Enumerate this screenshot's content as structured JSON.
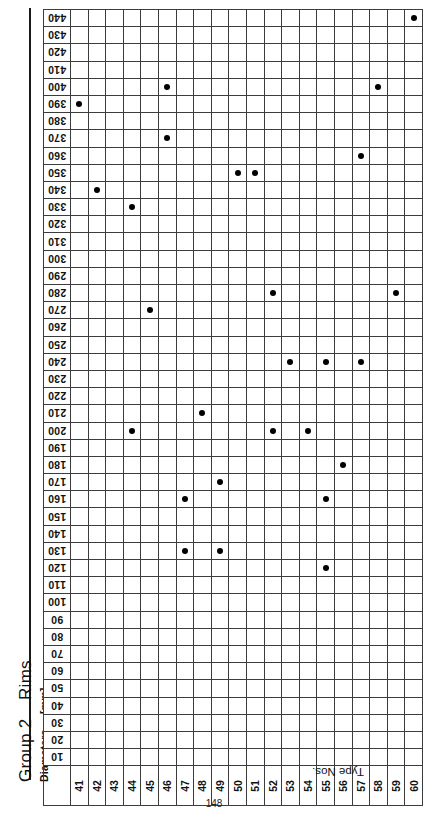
{
  "titles": {
    "group": "Group 2",
    "category": "Rims",
    "axis_name": "Diameters",
    "axis_unit": "[mm]",
    "x_caption": "Type Nos."
  },
  "page_number": "148",
  "chart_data": {
    "type": "scatter",
    "title": "Group 2 Rims",
    "xlabel": "Type Nos.",
    "ylabel": "Diameters [mm]",
    "grid": true,
    "legend_position": "none",
    "x_orientation": "rotated-90",
    "y_orientation": "rotated-180",
    "categories": [
      "41",
      "42",
      "43",
      "44",
      "45",
      "46",
      "47",
      "48",
      "49",
      "50",
      "51",
      "52",
      "53",
      "54",
      "55",
      "56",
      "57",
      "58",
      "59",
      "60"
    ],
    "y_ticks": [
      "440",
      "430",
      "420",
      "410",
      "400",
      "390",
      "380",
      "370",
      "360",
      "350",
      "340",
      "330",
      "320",
      "310",
      "300",
      "290",
      "280",
      "270",
      "260",
      "250",
      "240",
      "230",
      "220",
      "210",
      "200",
      "190",
      "180",
      "170",
      "160",
      "150",
      "140",
      "130",
      "120",
      "110",
      "100",
      "90",
      "80",
      "70",
      "60",
      "50",
      "40",
      "30",
      "20",
      "10"
    ],
    "ylim": [
      10,
      440
    ],
    "y_step": 10,
    "points": [
      {
        "type": "60",
        "diameter": "440"
      },
      {
        "type": "46",
        "diameter": "400"
      },
      {
        "type": "58",
        "diameter": "400"
      },
      {
        "type": "41",
        "diameter": "390"
      },
      {
        "type": "46",
        "diameter": "370"
      },
      {
        "type": "57",
        "diameter": "360"
      },
      {
        "type": "50",
        "diameter": "350"
      },
      {
        "type": "51",
        "diameter": "350"
      },
      {
        "type": "42",
        "diameter": "340"
      },
      {
        "type": "44",
        "diameter": "330"
      },
      {
        "type": "52",
        "diameter": "280"
      },
      {
        "type": "59",
        "diameter": "280"
      },
      {
        "type": "45",
        "diameter": "270"
      },
      {
        "type": "53",
        "diameter": "240"
      },
      {
        "type": "55",
        "diameter": "240"
      },
      {
        "type": "57",
        "diameter": "240"
      },
      {
        "type": "48",
        "diameter": "210"
      },
      {
        "type": "44",
        "diameter": "200"
      },
      {
        "type": "52",
        "diameter": "200"
      },
      {
        "type": "54",
        "diameter": "200"
      },
      {
        "type": "56",
        "diameter": "180"
      },
      {
        "type": "49",
        "diameter": "170"
      },
      {
        "type": "47",
        "diameter": "160"
      },
      {
        "type": "55",
        "diameter": "160"
      },
      {
        "type": "47",
        "diameter": "130"
      },
      {
        "type": "49",
        "diameter": "130"
      },
      {
        "type": "55",
        "diameter": "120"
      }
    ],
    "colors": {
      "point": "#000000",
      "grid_line": "#3c3c3c",
      "frame": "#111111",
      "background": "#ffffff"
    }
  }
}
